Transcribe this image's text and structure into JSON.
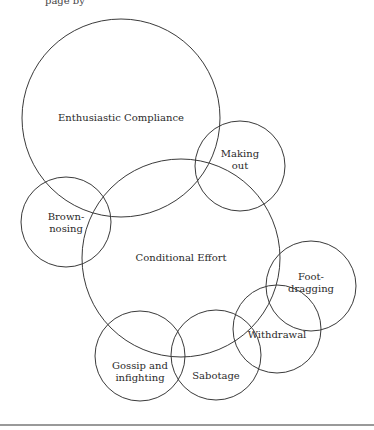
{
  "header_fragment": "page by",
  "diagram": {
    "type": "overlapping-circles",
    "nodes": [
      {
        "id": "enthusiastic-compliance",
        "lines": [
          "Enthusiastic Compliance"
        ]
      },
      {
        "id": "making-out",
        "lines": [
          "Making",
          "out"
        ]
      },
      {
        "id": "brown-nosing",
        "lines": [
          "Brown-",
          "nosing"
        ]
      },
      {
        "id": "conditional-effort",
        "lines": [
          "Conditional Effort"
        ]
      },
      {
        "id": "foot-dragging",
        "lines": [
          "Foot-",
          "dragging"
        ]
      },
      {
        "id": "withdrawal",
        "lines": [
          "Withdrawal"
        ]
      },
      {
        "id": "gossip-and-infighting",
        "lines": [
          "Gossip and",
          "infighting"
        ]
      },
      {
        "id": "sabotage",
        "lines": [
          "Sabotage"
        ]
      }
    ]
  }
}
